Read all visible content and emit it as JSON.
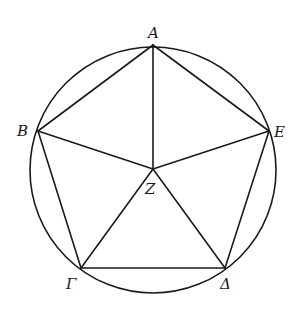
{
  "diagram": {
    "circle": {
      "cx": 153,
      "cy": 170,
      "r": 123
    },
    "center": {
      "name": "Z",
      "x": 153,
      "y": 169
    },
    "vertices": [
      {
        "name": "A",
        "x": 153,
        "y": 45
      },
      {
        "name": "B",
        "x": 38,
        "y": 131
      },
      {
        "name": "Γ",
        "x": 81,
        "y": 268
      },
      {
        "name": "Δ",
        "x": 225,
        "y": 268
      },
      {
        "name": "E",
        "x": 269,
        "y": 131
      }
    ],
    "labels": {
      "A": "A",
      "B": "B",
      "Gamma": "Γ",
      "Delta": "Δ",
      "E": "E",
      "Z": "Z"
    },
    "edges": [
      "AB",
      "BΓ",
      "ΓΔ",
      "ΔE",
      "EA"
    ],
    "radii": [
      "ZA",
      "ZB",
      "ZΓ",
      "ZΔ",
      "ZE"
    ]
  }
}
